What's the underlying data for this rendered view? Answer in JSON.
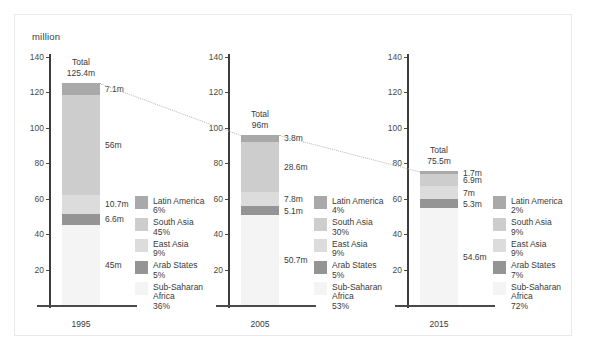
{
  "axis_unit_label": "million",
  "y_ticks": [
    140,
    120,
    100,
    80,
    60,
    40,
    20
  ],
  "legend_entries": [
    {
      "name": "Latin America",
      "color": "#a9a9a9"
    },
    {
      "name": "South Asia",
      "color": "#cdcdcd"
    },
    {
      "name": "East Asia",
      "color": "#dcdcdc"
    },
    {
      "name": "Arab States",
      "color": "#949494"
    },
    {
      "name": "Sub-Saharan Africa",
      "color": "#f4f4f4"
    }
  ],
  "groups": [
    {
      "year": "1995",
      "total_caption": "Total",
      "total_value": "125.4m",
      "total_number": 125.4,
      "segments": [
        {
          "region": "Latin America",
          "value": 7.1,
          "label": "7.1m",
          "percent": "6%"
        },
        {
          "region": "South Asia",
          "value": 56,
          "label": "56m",
          "percent": "45%"
        },
        {
          "region": "East Asia",
          "value": 10.7,
          "label": "10.7m",
          "percent": "9%"
        },
        {
          "region": "Arab States",
          "value": 6.6,
          "label": "6.6m",
          "percent": "5%"
        },
        {
          "region": "Sub-Saharan Africa",
          "value": 45,
          "label": "45m",
          "percent": "36%"
        }
      ]
    },
    {
      "year": "2005",
      "total_caption": "Total",
      "total_value": "96m",
      "total_number": 96,
      "segments": [
        {
          "region": "Latin America",
          "value": 3.8,
          "label": "3.8m",
          "percent": "4%"
        },
        {
          "region": "South Asia",
          "value": 28.6,
          "label": "28.6m",
          "percent": "30%"
        },
        {
          "region": "East Asia",
          "value": 7.8,
          "label": "7.8m",
          "percent": "9%"
        },
        {
          "region": "Arab States",
          "value": 5.1,
          "label": "5.1m",
          "percent": "5%"
        },
        {
          "region": "Sub-Saharan Africa",
          "value": 50.7,
          "label": "50.7m",
          "percent": "53%"
        }
      ]
    },
    {
      "year": "2015",
      "total_caption": "Total",
      "total_value": "75.5m",
      "total_number": 75.5,
      "segments": [
        {
          "region": "Latin America",
          "value": 1.7,
          "label": "1.7m",
          "percent": "2%"
        },
        {
          "region": "South Asia",
          "value": 6.9,
          "label": "6.9m",
          "percent": "9%"
        },
        {
          "region": "East Asia",
          "value": 7,
          "label": "7m",
          "percent": "9%"
        },
        {
          "region": "Arab States",
          "value": 5.3,
          "label": "5.3m",
          "percent": "7%"
        },
        {
          "region": "Sub-Saharan Africa",
          "value": 54.6,
          "label": "54.6m",
          "percent": "72%"
        }
      ]
    }
  ],
  "chart_data": {
    "type": "bar",
    "subtype": "stacked-bar",
    "title": "",
    "xlabel": "",
    "ylabel": "million",
    "ylim": [
      0,
      145
    ],
    "yticks": [
      20,
      40,
      60,
      80,
      100,
      120,
      140
    ],
    "grid": false,
    "legend_position": "right-of-each-bar",
    "categories": [
      "1995",
      "2005",
      "2015"
    ],
    "totals": [
      125.4,
      96,
      75.5
    ],
    "series": [
      {
        "name": "Sub-Saharan Africa",
        "values": [
          45,
          50.7,
          54.6
        ],
        "percents": [
          "36%",
          "53%",
          "72%"
        ],
        "color": "#f4f4f4"
      },
      {
        "name": "Arab States",
        "values": [
          6.6,
          5.1,
          5.3
        ],
        "percents": [
          "5%",
          "5%",
          "7%"
        ],
        "color": "#949494"
      },
      {
        "name": "East Asia",
        "values": [
          10.7,
          7.8,
          7
        ],
        "percents": [
          "9%",
          "9%",
          "9%"
        ],
        "color": "#dcdcdc"
      },
      {
        "name": "South Asia",
        "values": [
          56,
          28.6,
          6.9
        ],
        "percents": [
          "45%",
          "30%",
          "9%"
        ],
        "color": "#cdcdcd"
      },
      {
        "name": "Latin America",
        "values": [
          7.1,
          3.8,
          1.7
        ],
        "percents": [
          "6%",
          "4%",
          "2%"
        ],
        "color": "#a9a9a9"
      }
    ],
    "annotations": [
      "Total 125.4m",
      "Total 96m",
      "Total 75.5m"
    ],
    "connectors": [
      {
        "from": "1995 top (125.4)",
        "to": "2005 top (96)"
      },
      {
        "from": "2005 top (96)",
        "to": "2015 top (75.5)"
      }
    ]
  }
}
